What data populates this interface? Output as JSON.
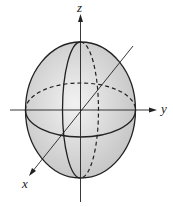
{
  "diagram": {
    "title": "",
    "type": "ellipsoid",
    "axes": {
      "x": "x",
      "y": "y",
      "z": "z"
    },
    "colors": {
      "fill": "#d8d8d8",
      "stroke": "#222222",
      "background": "#ffffff"
    }
  }
}
